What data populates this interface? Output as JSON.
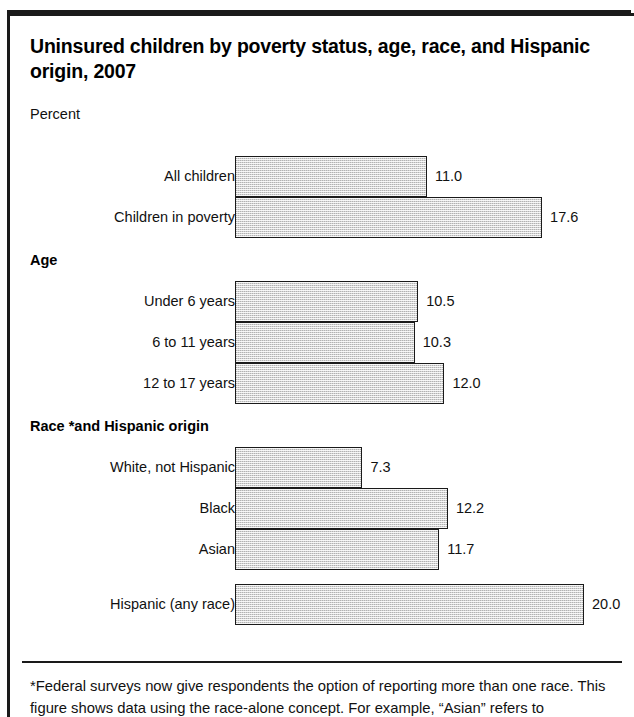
{
  "figure": {
    "title": "Uninsured children by poverty status, age, race, and Hispanic origin, 2007",
    "axis_label": "Percent",
    "footnote": "*Federal surveys now give respondents the option of reporting more than one race. This figure shows data using the race-alone concept. For example, “Asian” refers to"
  },
  "chart_data": {
    "type": "bar",
    "orientation": "horizontal",
    "title": "Uninsured children by poverty status, age, race, and Hispanic origin, 2007",
    "xlabel": "Percent",
    "ylabel": "",
    "xlim": [
      0,
      20
    ],
    "grid": false,
    "legend": null,
    "value_format": "one-decimal",
    "units": "percent",
    "groups": [
      {
        "header": "",
        "bars": [
          {
            "label": "All children",
            "value": 11.0,
            "value_text": "11.0"
          },
          {
            "label": "Children in poverty",
            "value": 17.6,
            "value_text": "17.6"
          }
        ]
      },
      {
        "header": "Age",
        "bars": [
          {
            "label": "Under 6 years",
            "value": 10.5,
            "value_text": "10.5"
          },
          {
            "label": "6 to 11 years",
            "value": 10.3,
            "value_text": "10.3"
          },
          {
            "label": "12 to 17 years",
            "value": 12.0,
            "value_text": "12.0"
          }
        ]
      },
      {
        "header": "Race *and Hispanic origin",
        "bars": [
          {
            "label": "White, not Hispanic",
            "value": 7.3,
            "value_text": "7.3"
          },
          {
            "label": "Black",
            "value": 12.2,
            "value_text": "12.2"
          },
          {
            "label": "Asian",
            "value": 11.7,
            "value_text": "11.7"
          }
        ]
      },
      {
        "header": "",
        "bars": [
          {
            "label": "Hispanic (any race)",
            "value": 20.0,
            "value_text": "20.0"
          }
        ]
      }
    ],
    "categories": [
      "All children",
      "Children in poverty",
      "Under 6 years",
      "6 to 11 years",
      "12 to 17 years",
      "White, not Hispanic",
      "Black",
      "Asian",
      "Hispanic (any race)"
    ],
    "values": [
      11.0,
      17.6,
      10.5,
      10.3,
      12.0,
      7.3,
      12.2,
      11.7,
      20.0
    ]
  },
  "colors": {
    "bar_fill": "#d4d4d4",
    "bar_stroke": "#1a1a1a",
    "text": "#111111",
    "frame": "#1a1a1a",
    "background": "#ffffff"
  }
}
